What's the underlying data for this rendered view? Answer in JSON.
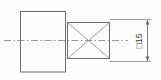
{
  "drawing": {
    "title": "Shaft end with square section — sectional view",
    "background_color": "#fdfdfd",
    "line_color": "#6e6e6e",
    "centerline_color": "#8d8d8d",
    "text_color": "#3d3d3d",
    "parts": {
      "body_label": "shaft body outline",
      "square_section_label": "square section with crossed diagonals",
      "centerline_label": "horizontal axis centerline"
    },
    "dimension": {
      "symbol": "□",
      "value": "15",
      "full_text": "□15",
      "orientation": "rotated-90-ccw",
      "applies_to": "square section across flats"
    }
  }
}
